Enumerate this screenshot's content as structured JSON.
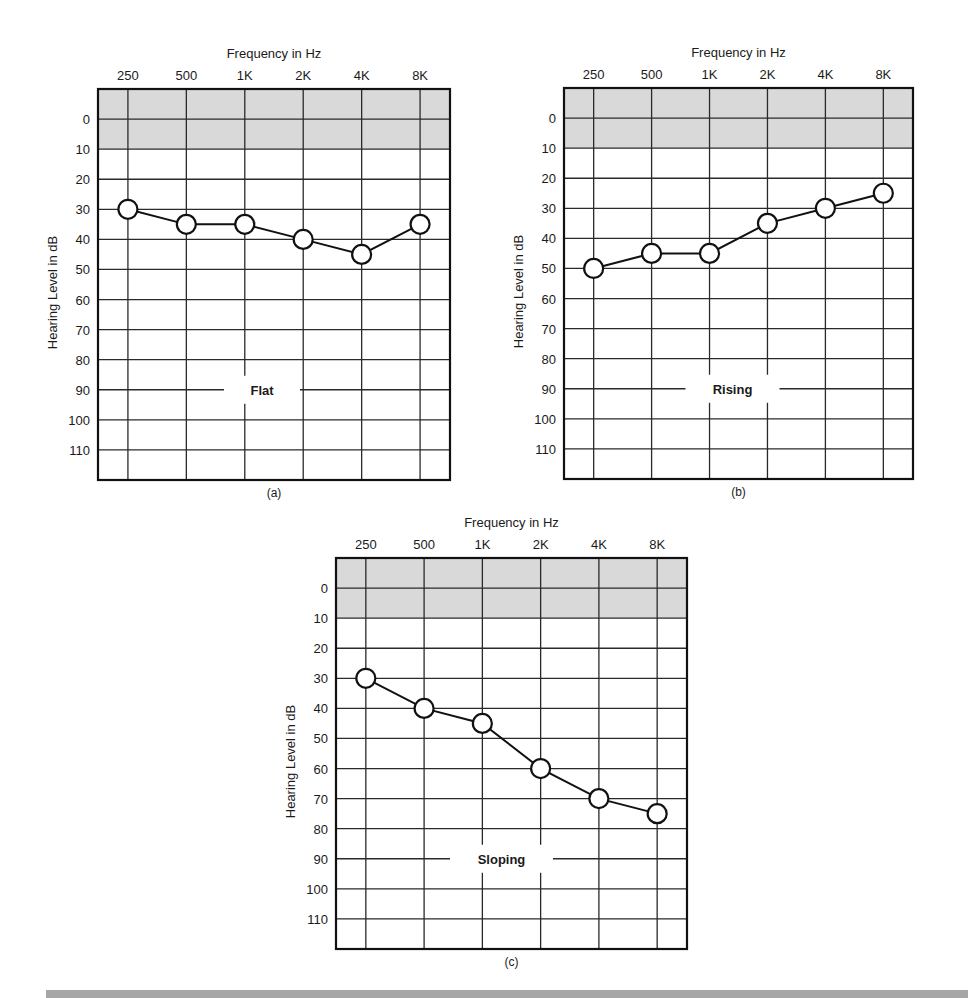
{
  "chart_data": [
    {
      "type": "line",
      "panel_label": "(a)",
      "title": "",
      "annotation": "Flat",
      "xlabel": "Frequency in Hz",
      "ylabel": "Hearing Level in dB",
      "categories": [
        "250",
        "500",
        "1K",
        "2K",
        "4K",
        "8K"
      ],
      "y_ticks": [
        0,
        10,
        20,
        30,
        40,
        50,
        60,
        70,
        80,
        90,
        100,
        110
      ],
      "ylim": [
        -10,
        120
      ],
      "y_inverted": true,
      "shaded_band": [
        -10,
        10
      ],
      "grid": true,
      "series": [
        {
          "name": "Flat",
          "values": [
            30,
            35,
            35,
            40,
            45,
            35
          ]
        }
      ]
    },
    {
      "type": "line",
      "panel_label": "(b)",
      "title": "",
      "annotation": "Rising",
      "xlabel": "Frequency in Hz",
      "ylabel": "Hearing Level in dB",
      "categories": [
        "250",
        "500",
        "1K",
        "2K",
        "4K",
        "8K"
      ],
      "y_ticks": [
        0,
        10,
        20,
        30,
        40,
        50,
        60,
        70,
        80,
        90,
        100,
        110
      ],
      "ylim": [
        -10,
        120
      ],
      "y_inverted": true,
      "shaded_band": [
        -10,
        10
      ],
      "grid": true,
      "series": [
        {
          "name": "Rising",
          "values": [
            50,
            45,
            45,
            35,
            30,
            25
          ]
        }
      ]
    },
    {
      "type": "line",
      "panel_label": "(c)",
      "title": "",
      "annotation": "Sloping",
      "xlabel": "Frequency in Hz",
      "ylabel": "Hearing Level in dB",
      "categories": [
        "250",
        "500",
        "1K",
        "2K",
        "4K",
        "8K"
      ],
      "y_ticks": [
        0,
        10,
        20,
        30,
        40,
        50,
        60,
        70,
        80,
        90,
        100,
        110
      ],
      "ylim": [
        -10,
        120
      ],
      "y_inverted": true,
      "shaded_band": [
        -10,
        10
      ],
      "grid": true,
      "series": [
        {
          "name": "Sloping",
          "values": [
            30,
            40,
            45,
            60,
            70,
            75
          ]
        }
      ]
    }
  ],
  "colors": {
    "shade": "#d9d9d9",
    "grid": "#2a2a2a",
    "border": "#111111",
    "marker_fill": "#ffffff",
    "marker_stroke": "#111111",
    "bottom_bar": "#a6a6a6"
  }
}
